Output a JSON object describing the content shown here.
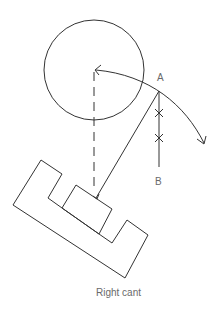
{
  "diagram": {
    "caption": "Right cant",
    "labels": {
      "point_a": "A",
      "point_b": "B"
    },
    "colors": {
      "stroke": "#333333",
      "label": "#6a6a6a",
      "background": "#ffffff"
    },
    "elements": [
      "circle",
      "curved-arrow",
      "dashed-vertical-line",
      "vertical-line-ab",
      "diagonal-line",
      "cross-marks",
      "stepped-block"
    ]
  }
}
